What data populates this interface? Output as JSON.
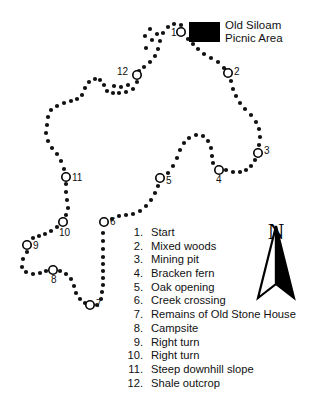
{
  "map": {
    "title_symbol": "picnic-area-symbol",
    "picnic_area": {
      "line1": "Old Siloam",
      "line2": "Picnic Area"
    },
    "compass": {
      "letter": "N",
      "name": "north-arrow"
    },
    "markers": [
      {
        "id": "1",
        "x": 181,
        "y": 32,
        "label_dx": -10,
        "label_dy": 4
      },
      {
        "id": "2",
        "x": 228,
        "y": 73,
        "label_dx": 6,
        "label_dy": 2
      },
      {
        "id": "3",
        "x": 258,
        "y": 153,
        "label_dx": 6,
        "label_dy": 1
      },
      {
        "id": "4",
        "x": 219,
        "y": 170,
        "label_dx": -3,
        "label_dy": 13
      },
      {
        "id": "5",
        "x": 160,
        "y": 178,
        "label_dx": 6,
        "label_dy": 6
      },
      {
        "id": "6",
        "x": 104,
        "y": 222,
        "label_dx": 6,
        "label_dy": 3
      },
      {
        "id": "7",
        "x": 90,
        "y": 305,
        "label_dx": 6,
        "label_dy": 2
      },
      {
        "id": "8",
        "x": 53,
        "y": 270,
        "label_dx": -2,
        "label_dy": 13
      },
      {
        "id": "9",
        "x": 27,
        "y": 245,
        "label_dx": 6,
        "label_dy": 4
      },
      {
        "id": "10",
        "x": 63,
        "y": 222,
        "label_dx": -4,
        "label_dy": 14
      },
      {
        "id": "11",
        "x": 66,
        "y": 177,
        "label_dx": 6,
        "label_dy": 4
      },
      {
        "id": "12",
        "x": 137,
        "y": 75,
        "label_dx": -20,
        "label_dy": 0
      }
    ],
    "trail_dots": [
      [
        181,
        25
      ],
      [
        174,
        24
      ],
      [
        168,
        27
      ],
      [
        163,
        33
      ],
      [
        160,
        41
      ],
      [
        158,
        49
      ],
      [
        155,
        56
      ],
      [
        150,
        62
      ],
      [
        144,
        67
      ],
      [
        139,
        71
      ],
      [
        137,
        82
      ],
      [
        133,
        89
      ],
      [
        126,
        92
      ],
      [
        119,
        93
      ],
      [
        113,
        93
      ],
      [
        107,
        91
      ],
      [
        104,
        85
      ],
      [
        100,
        80
      ],
      [
        95,
        79
      ],
      [
        89,
        82
      ],
      [
        85,
        88
      ],
      [
        82,
        95
      ],
      [
        77,
        99
      ],
      [
        71,
        101
      ],
      [
        64,
        103
      ],
      [
        57,
        106
      ],
      [
        51,
        110
      ],
      [
        48,
        117
      ],
      [
        47,
        125
      ],
      [
        46,
        133
      ],
      [
        48,
        141
      ],
      [
        52,
        148
      ],
      [
        57,
        154
      ],
      [
        61,
        161
      ],
      [
        64,
        169
      ],
      [
        66,
        184
      ],
      [
        66,
        192
      ],
      [
        67,
        200
      ],
      [
        68,
        208
      ],
      [
        66,
        215
      ],
      [
        57,
        227
      ],
      [
        51,
        231
      ],
      [
        45,
        234
      ],
      [
        39,
        236
      ],
      [
        33,
        238
      ],
      [
        27,
        252
      ],
      [
        23,
        259
      ],
      [
        22,
        267
      ],
      [
        26,
        272
      ],
      [
        33,
        274
      ],
      [
        40,
        273
      ],
      [
        46,
        271
      ],
      [
        60,
        271
      ],
      [
        66,
        274
      ],
      [
        71,
        279
      ],
      [
        74,
        286
      ],
      [
        76,
        293
      ],
      [
        80,
        299
      ],
      [
        85,
        303
      ],
      [
        97,
        305
      ],
      [
        101,
        299
      ],
      [
        102,
        292
      ],
      [
        103,
        285
      ],
      [
        103,
        278
      ],
      [
        103,
        271
      ],
      [
        103,
        264
      ],
      [
        103,
        257
      ],
      [
        103,
        249
      ],
      [
        103,
        241
      ],
      [
        103,
        233
      ],
      [
        112,
        219
      ],
      [
        119,
        216
      ],
      [
        126,
        215
      ],
      [
        133,
        214
      ],
      [
        140,
        211
      ],
      [
        146,
        206
      ],
      [
        151,
        200
      ],
      [
        155,
        193
      ],
      [
        158,
        186
      ],
      [
        168,
        173
      ],
      [
        173,
        166
      ],
      [
        177,
        158
      ],
      [
        180,
        150
      ],
      [
        184,
        143
      ],
      [
        189,
        138
      ],
      [
        196,
        135
      ],
      [
        203,
        136
      ],
      [
        208,
        141
      ],
      [
        211,
        148
      ],
      [
        212,
        156
      ],
      [
        213,
        163
      ],
      [
        226,
        170
      ],
      [
        233,
        172
      ],
      [
        240,
        172
      ],
      [
        246,
        170
      ],
      [
        251,
        166
      ],
      [
        255,
        160
      ],
      [
        259,
        145
      ],
      [
        260,
        137
      ],
      [
        259,
        129
      ],
      [
        256,
        122
      ],
      [
        251,
        115
      ],
      [
        245,
        109
      ],
      [
        240,
        103
      ],
      [
        236,
        96
      ],
      [
        233,
        89
      ],
      [
        231,
        81
      ],
      [
        224,
        68
      ],
      [
        218,
        62
      ],
      [
        211,
        58
      ],
      [
        204,
        54
      ],
      [
        198,
        49
      ],
      [
        193,
        44
      ],
      [
        188,
        39
      ],
      [
        146,
        48
      ],
      [
        152,
        40
      ],
      [
        157,
        34
      ],
      [
        150,
        29
      ],
      [
        145,
        36
      ],
      [
        128,
        85
      ],
      [
        121,
        87
      ],
      [
        114,
        86
      ]
    ]
  },
  "legend": {
    "name": "trail-legend",
    "items": [
      {
        "num": "1.",
        "text": "Start"
      },
      {
        "num": "2.",
        "text": "Mixed woods"
      },
      {
        "num": "3.",
        "text": "Mining pit"
      },
      {
        "num": "4.",
        "text": "Bracken fern"
      },
      {
        "num": "5.",
        "text": "Oak opening"
      },
      {
        "num": "6.",
        "text": "Creek crossing"
      },
      {
        "num": "7.",
        "text": "Remains of Old Stone House"
      },
      {
        "num": "8.",
        "text": "Campsite"
      },
      {
        "num": "9.",
        "text": "Right turn"
      },
      {
        "num": "10.",
        "text": "Right turn"
      },
      {
        "num": "11.",
        "text": "Steep downhill slope"
      },
      {
        "num": "12.",
        "text": "Shale outcrop"
      }
    ]
  },
  "colors": {
    "ink": "#111111",
    "paper": "#ffffff",
    "symbol_fill": "#000000"
  }
}
